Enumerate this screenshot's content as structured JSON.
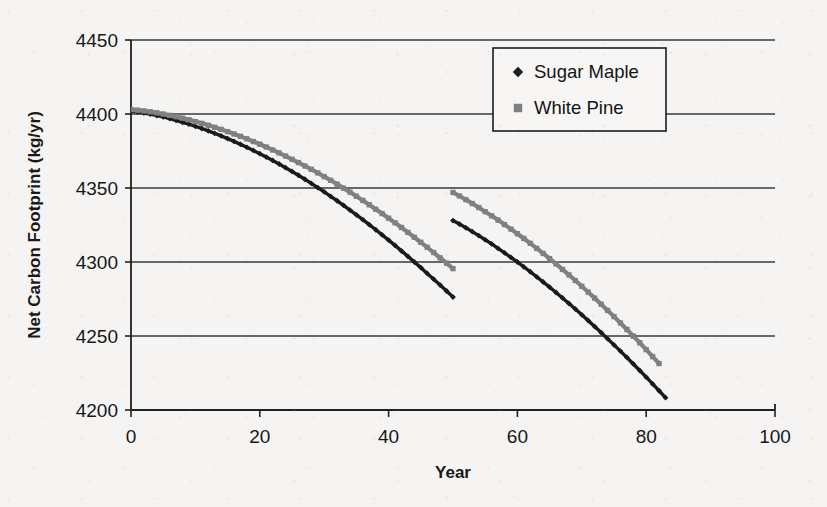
{
  "chart_data": {
    "type": "line",
    "title": "",
    "xlabel": "Year",
    "ylabel": "Net Carbon Footprint (kg/yr)",
    "xlim": [
      0,
      100
    ],
    "ylim": [
      4200,
      4450
    ],
    "xticks": [
      "0",
      "20",
      "40",
      "60",
      "80",
      "100"
    ],
    "yticks": [
      "4200",
      "4250",
      "4300",
      "4350",
      "4400",
      "4450"
    ],
    "grid": "horizontal",
    "legend_position": "top-right-inside",
    "legend": [
      {
        "name": "Sugar Maple",
        "marker": "diamond",
        "color": "#1a1a1a"
      },
      {
        "name": "White Pine",
        "marker": "square",
        "color": "#808080"
      }
    ],
    "note": "Both series show a discontinuity at year 50 where values step upward then resume declining.",
    "series": [
      {
        "name": "Sugar Maple",
        "marker": "diamond",
        "color": "#1a1a1a",
        "x": [
          0,
          1,
          2,
          3,
          4,
          5,
          6,
          7,
          8,
          9,
          10,
          11,
          12,
          13,
          14,
          15,
          16,
          17,
          18,
          19,
          20,
          21,
          22,
          23,
          24,
          25,
          26,
          27,
          28,
          29,
          30,
          31,
          32,
          33,
          34,
          35,
          36,
          37,
          38,
          39,
          40,
          41,
          42,
          43,
          44,
          45,
          46,
          47,
          48,
          49,
          50,
          50,
          51,
          52,
          53,
          54,
          55,
          56,
          57,
          58,
          59,
          60,
          61,
          62,
          63,
          64,
          65,
          66,
          67,
          68,
          69,
          70,
          71,
          72,
          73,
          74,
          75,
          76,
          77,
          78,
          79,
          80,
          81,
          82,
          83
        ],
        "y": [
          4402,
          4401.4,
          4400.7,
          4399.9,
          4399.0,
          4398.0,
          4396.9,
          4395.7,
          4394.4,
          4393.1,
          4391.7,
          4390.2,
          4388.6,
          4386.9,
          4385.2,
          4383.4,
          4381.5,
          4379.5,
          4377.5,
          4375.4,
          4373.2,
          4370.9,
          4368.6,
          4366.2,
          4363.7,
          4361.2,
          4358.6,
          4355.9,
          4353.1,
          4350.3,
          4347.4,
          4344.4,
          4341.4,
          4338.3,
          4335.1,
          4331.9,
          4328.6,
          4325.2,
          4321.8,
          4318.3,
          4314.8,
          4311.2,
          4307.5,
          4303.8,
          4300.0,
          4296.2,
          4292.3,
          4288.4,
          4284.4,
          4280.4,
          4276.3,
          4328.0,
          4325.6,
          4323.1,
          4320.5,
          4317.8,
          4315.0,
          4312.2,
          4309.2,
          4306.2,
          4303.1,
          4300.0,
          4296.7,
          4293.4,
          4290.0,
          4286.5,
          4283.0,
          4279.4,
          4275.7,
          4272.0,
          4268.2,
          4264.3,
          4260.4,
          4256.4,
          4252.3,
          4248.2,
          4244.0,
          4239.8,
          4235.5,
          4231.1,
          4226.7,
          4222.2,
          4217.6,
          4213.0,
          4208.3
        ]
      },
      {
        "name": "White Pine",
        "marker": "square",
        "color": "#808080",
        "x": [
          0,
          1,
          2,
          3,
          4,
          5,
          6,
          7,
          8,
          9,
          10,
          11,
          12,
          13,
          14,
          15,
          16,
          17,
          18,
          19,
          20,
          21,
          22,
          23,
          24,
          25,
          26,
          27,
          28,
          29,
          30,
          31,
          32,
          33,
          34,
          35,
          36,
          37,
          38,
          39,
          40,
          41,
          42,
          43,
          44,
          45,
          46,
          47,
          48,
          49,
          50,
          50,
          51,
          52,
          53,
          54,
          55,
          56,
          57,
          58,
          59,
          60,
          61,
          62,
          63,
          64,
          65,
          66,
          67,
          68,
          69,
          70,
          71,
          72,
          73,
          74,
          75,
          76,
          77,
          78,
          79,
          80,
          81,
          82
        ],
        "y": [
          4403,
          4402.6,
          4402.1,
          4401.5,
          4400.8,
          4400.0,
          4399.1,
          4398.2,
          4397.2,
          4396.1,
          4394.9,
          4393.7,
          4392.4,
          4391.0,
          4389.6,
          4388.1,
          4386.5,
          4384.9,
          4383.2,
          4381.4,
          4379.6,
          4377.7,
          4375.7,
          4373.7,
          4371.6,
          4369.4,
          4367.2,
          4364.9,
          4362.6,
          4360.2,
          4357.7,
          4355.2,
          4352.6,
          4349.9,
          4347.2,
          4344.4,
          4341.6,
          4338.7,
          4335.7,
          4332.7,
          4329.6,
          4326.5,
          4323.3,
          4320.0,
          4316.7,
          4313.3,
          4309.9,
          4306.4,
          4302.8,
          4299.2,
          4295.5,
          4347.0,
          4344.6,
          4342.1,
          4339.5,
          4336.8,
          4334.0,
          4331.2,
          4328.3,
          4325.3,
          4322.2,
          4319.1,
          4315.9,
          4312.6,
          4309.2,
          4305.8,
          4302.3,
          4298.7,
          4295.0,
          4291.3,
          4287.5,
          4283.6,
          4279.6,
          4275.6,
          4271.5,
          4267.3,
          4263.1,
          4258.8,
          4254.4,
          4249.9,
          4245.4,
          4240.8,
          4236.1,
          4231.4
        ]
      }
    ]
  }
}
